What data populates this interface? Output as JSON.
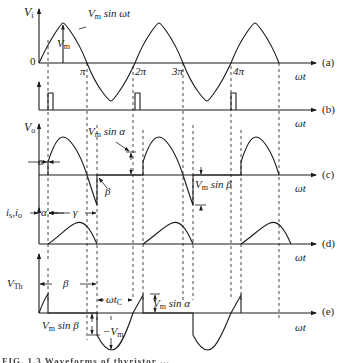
{
  "figure": {
    "panels": [
      {
        "id": "a",
        "tag": "(a)",
        "ylabel": "V",
        "ylabel_sub": "i",
        "xlabel": "ωt",
        "curve_label": "V",
        "curve_label_sub": "m",
        "curve_label_tail": " sin ωt",
        "amplitude_label": "V",
        "amplitude_label_sub": "m",
        "origin_label": "0",
        "ticks": [
          "π",
          "2π",
          "3π",
          "4π"
        ]
      },
      {
        "id": "b",
        "tag": "(b)",
        "xlabel": "ωt",
        "description": "gate pulses"
      },
      {
        "id": "c",
        "tag": "(c)",
        "ylabel": "V",
        "ylabel_sub": "o",
        "xlabel": "ωt",
        "alpha_label": "α",
        "beta_label": "β",
        "vm_sin_alpha": {
          "v": "V",
          "sub": "m",
          "tail": " sin α"
        },
        "vm_sin_beta": {
          "v": "V",
          "sub": "m",
          "tail": " sin β"
        }
      },
      {
        "id": "d",
        "tag": "(d)",
        "ylabel": "i",
        "ylabel_sub": "s",
        "ylabel2": ",i",
        "ylabel2_sub": "o",
        "xlabel": "ωt",
        "alpha_label": "α",
        "gamma_label": "γ"
      },
      {
        "id": "e",
        "tag": "(e)",
        "ylabel": "V",
        "ylabel_sub": "Th",
        "xlabel": "ωt",
        "beta_label": "β",
        "wtc": {
          "v": "ωt",
          "sub": "C"
        },
        "vm_sin_alpha": {
          "v": "V",
          "sub": "m",
          "tail": " sin α"
        },
        "vm_sin_beta": {
          "v": "V",
          "sub": "m",
          "tail": " sin β"
        },
        "neg_vm": {
          "v": "−V",
          "sub": "m"
        }
      }
    ],
    "caption": "FIG. 1.3 Waveforms of thyristor ..."
  },
  "colors": {
    "line": "#1a1a1a",
    "background": "#ffffff"
  }
}
